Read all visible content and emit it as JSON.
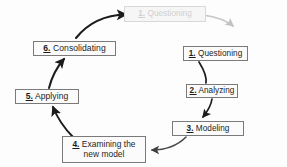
{
  "diagram": {
    "type": "cycle",
    "title": "",
    "nodes": [
      {
        "id": "restart-questioning",
        "number": "1.",
        "label": "Questioning",
        "full_text": "1. Questioning",
        "state": "faded",
        "color": "#cfcfcf",
        "border_color": "#d8d8d8",
        "fill": "#f6f6f6"
      },
      {
        "id": "questioning",
        "number": "1.",
        "label": "Questioning",
        "full_text": "1. Questioning",
        "state": "normal",
        "color": "#1c1c1c",
        "border_color": "#7a7a7a",
        "fill": "#fbfbfb"
      },
      {
        "id": "analyzing",
        "number": "2.",
        "label": "Analyzing",
        "full_text": "2. Analyzing",
        "state": "normal",
        "color": "#1c1c1c",
        "border_color": "#7a7a7a",
        "fill": "#fbfbfb"
      },
      {
        "id": "modeling",
        "number": "3.",
        "label": "Modeling",
        "full_text": "3. Modeling",
        "state": "normal",
        "color": "#1c1c1c",
        "border_color": "#7a7a7a",
        "fill": "#fbfbfb"
      },
      {
        "id": "examining",
        "number": "4.",
        "label": "Examining the\nnew model",
        "full_text": "4. Examining the new model",
        "state": "normal",
        "color": "#1c1c1c",
        "border_color": "#7a7a7a",
        "fill": "#fbfbfb"
      },
      {
        "id": "applying",
        "number": "5.",
        "label": "Applying",
        "full_text": "5. Applying",
        "state": "normal",
        "color": "#1c1c1c",
        "border_color": "#7a7a7a",
        "fill": "#fbfbfb"
      },
      {
        "id": "consolidating",
        "number": "6.",
        "label": "Consolidating",
        "full_text": "6. Consolidating",
        "state": "normal",
        "color": "#1c1c1c",
        "border_color": "#7a7a7a",
        "fill": "#fbfbfb"
      }
    ],
    "edges": [
      {
        "id": "edge-questioning-analyzing",
        "from": "questioning",
        "to": "analyzing",
        "style": "curved-arrow",
        "color": "#1c1c1c"
      },
      {
        "id": "edge-analyzing-modeling",
        "from": "analyzing",
        "to": "modeling",
        "style": "curved-arrow",
        "color": "#1c1c1c"
      },
      {
        "id": "edge-modeling-examining",
        "from": "modeling",
        "to": "examining",
        "style": "curved-arrow",
        "color": "#4a4a4a"
      },
      {
        "id": "edge-examining-applying",
        "from": "examining",
        "to": "applying",
        "style": "curved-arrow",
        "color": "#1c1c1c"
      },
      {
        "id": "edge-applying-consolidating",
        "from": "applying",
        "to": "consolidating",
        "style": "curved-arrow",
        "color": "#1c1c1c"
      },
      {
        "id": "edge-consolidating-restart",
        "from": "consolidating",
        "to": "restart-questioning",
        "style": "curved-arrow",
        "color": "#1c1c1c"
      },
      {
        "id": "edge-restart-outgoing",
        "from": "restart-questioning",
        "to": "",
        "style": "curved-arrow-faded",
        "color": "#bdbdbd"
      }
    ]
  }
}
